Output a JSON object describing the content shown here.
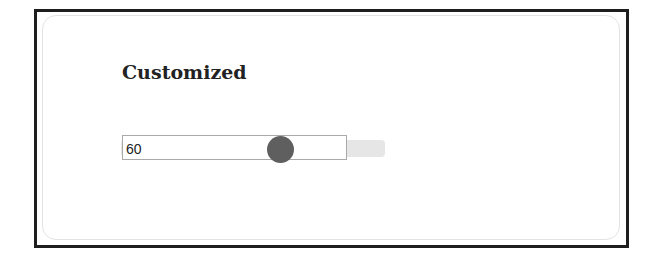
{
  "panel": {
    "title": "Customized"
  },
  "slider": {
    "value": "60",
    "min": 0,
    "max": 100,
    "colors": {
      "track": "#e6e6e6",
      "thumb": "#5f5f5f",
      "frame": "#1e1e1e"
    }
  }
}
